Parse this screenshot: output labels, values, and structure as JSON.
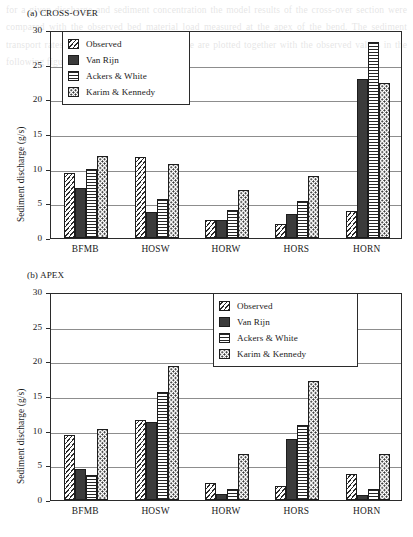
{
  "figure": {
    "background_bleed_text": "for a given discharge and sediment concentration the model results of the cross-over section were compared with the observed bed material load measured at the apex of the bend. The sediment transport rates predicted by the three formulae are plotted together with the observed values in the following figure."
  },
  "panels": [
    {
      "title": "(a) CROSS-OVER",
      "ylabel": "Sediment discharge (g/s)",
      "legend_position": "top-left",
      "chart_data": {
        "type": "bar",
        "title": "(a) CROSS-OVER",
        "xlabel": "",
        "ylabel": "Sediment discharge (g/s)",
        "ylim": [
          0,
          30
        ],
        "yticks": [
          0,
          5,
          10,
          15,
          20,
          25,
          30
        ],
        "grid": true,
        "legend": [
          "Observed",
          "Van Rijn",
          "Ackers & White",
          "Karim & Kennedy"
        ],
        "categories": [
          "BFMB",
          "HOSW",
          "HORW",
          "HORS",
          "HORN"
        ],
        "series": [
          {
            "name": "Observed",
            "values": [
              9.4,
              11.7,
              2.6,
              2.0,
              3.9
            ]
          },
          {
            "name": "Van Rijn",
            "values": [
              7.2,
              3.7,
              2.6,
              3.5,
              22.9
            ]
          },
          {
            "name": "Ackers & White",
            "values": [
              10.0,
              5.6,
              4.1,
              5.4,
              28.2
            ]
          },
          {
            "name": "Karim & Kennedy",
            "values": [
              11.8,
              10.7,
              6.9,
              8.9,
              22.3
            ]
          }
        ]
      }
    },
    {
      "title": "(b) APEX",
      "ylabel": "Sediment discharge (g/s)",
      "legend_position": "top-right",
      "chart_data": {
        "type": "bar",
        "title": "(b) APEX",
        "xlabel": "",
        "ylabel": "Sediment discharge (g/s)",
        "ylim": [
          0,
          30
        ],
        "yticks": [
          0,
          5,
          10,
          15,
          20,
          25,
          30
        ],
        "grid": true,
        "legend": [
          "Observed",
          "Van Rijn",
          "Ackers & White",
          "Karim & Kennedy"
        ],
        "categories": [
          "BFMB",
          "HOSW",
          "HORW",
          "HORS",
          "HORN"
        ],
        "series": [
          {
            "name": "Observed",
            "values": [
              9.4,
              11.6,
              2.5,
              2.0,
              3.8
            ]
          },
          {
            "name": "Van Rijn",
            "values": [
              4.5,
              11.3,
              0.8,
              8.8,
              0.7
            ]
          },
          {
            "name": "Ackers & White",
            "values": [
              3.6,
              15.6,
              1.6,
              10.8,
              1.6
            ]
          },
          {
            "name": "Karim & Kennedy",
            "values": [
              10.3,
              19.3,
              6.7,
              17.1,
              6.7
            ]
          }
        ]
      }
    }
  ],
  "series_styles": [
    "observed",
    "vanrijn",
    "ackers",
    "karim"
  ],
  "colors": {
    "axis": "#2b2b2b",
    "grid": "#8d8d8d",
    "bar_outline": "#1d1d1d",
    "vanrijn_fill": "#3b3b3b",
    "background": "#ffffff"
  }
}
